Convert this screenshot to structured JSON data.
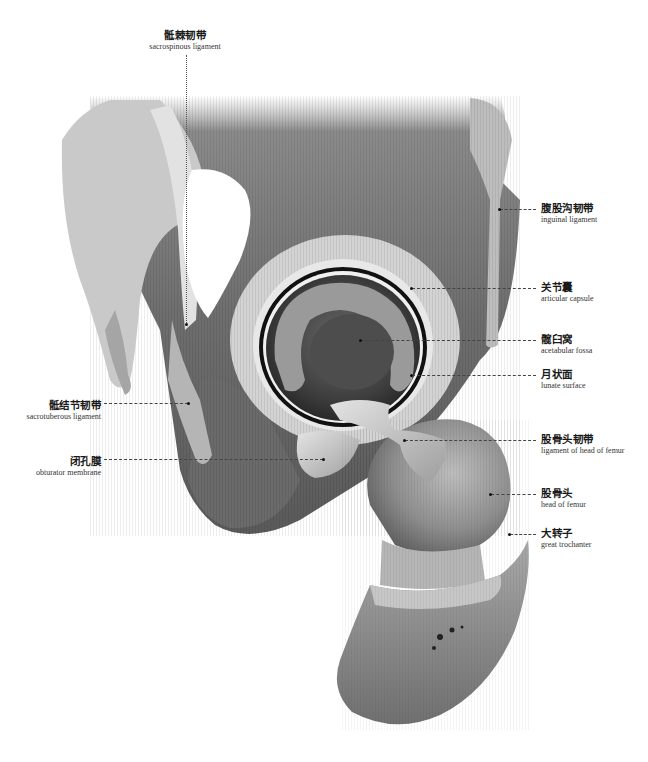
{
  "figure": {
    "colors": {
      "bone_dark": "#5e5e5e",
      "bone_mid": "#8c8c8c",
      "bone_light": "#c8c8c8",
      "ligament": "#d9d9d9",
      "leader": "#444444",
      "text": "#1a1a1a"
    }
  },
  "labels": {
    "sacrospinous": {
      "zh": "骶棘韧带",
      "en": "sacrospinous ligament"
    },
    "inguinal": {
      "zh": "腹股沟韧带",
      "en": "inguinal ligament"
    },
    "capsule": {
      "zh": "关节囊",
      "en": "articular capsule"
    },
    "fossa": {
      "zh": "髋臼窝",
      "en": "acetabular fossa"
    },
    "lunate": {
      "zh": "月状面",
      "en": "lunate surface"
    },
    "sacrotuberous": {
      "zh": "骶结节韧带",
      "en": "sacrotuberous ligament"
    },
    "lig_head": {
      "zh": "股骨头韧带",
      "en": "ligament of head of femur"
    },
    "obturator": {
      "zh": "闭孔膜",
      "en": "obturator membrane"
    },
    "head": {
      "zh": "股骨头",
      "en": "head of femur"
    },
    "trochanter": {
      "zh": "大转子",
      "en": "great trochanter"
    }
  }
}
